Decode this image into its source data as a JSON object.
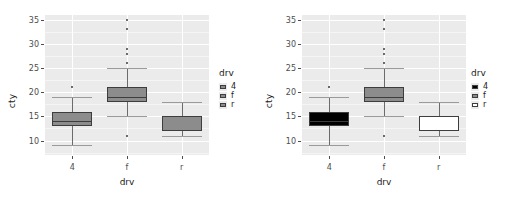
{
  "figure": {
    "panels": [
      {
        "id": "left",
        "fill_mode": "uniform-grey",
        "axis": {
          "ylabel": "cty",
          "xlabel": "drv"
        },
        "legend": {
          "title": "drv",
          "items": [
            {
              "label": "4",
              "color": "#8c8c8c"
            },
            {
              "label": "f",
              "color": "#8c8c8c"
            },
            {
              "label": "r",
              "color": "#8c8c8c"
            }
          ]
        }
      },
      {
        "id": "right",
        "fill_mode": "greyscale-ramp",
        "axis": {
          "ylabel": "cty",
          "xlabel": "drv"
        },
        "legend": {
          "title": "drv",
          "items": [
            {
              "label": "4",
              "color": "#000000"
            },
            {
              "label": "f",
              "color": "#8c8c8c"
            },
            {
              "label": "r",
              "color": "#ffffff"
            }
          ]
        }
      }
    ]
  },
  "chart_data": [
    {
      "type": "box",
      "title": "",
      "xlabel": "drv",
      "ylabel": "cty",
      "ylim": [
        7,
        36
      ],
      "yticks": [
        10,
        15,
        20,
        25,
        30,
        35
      ],
      "ytick_labels": [
        "10",
        "15",
        "20",
        "25",
        "30",
        "35"
      ],
      "categories": [
        "4",
        "f",
        "r"
      ],
      "grid": true,
      "legend": {
        "title": "drv",
        "position": "right",
        "entries": [
          "4",
          "f",
          "r"
        ]
      },
      "fills": [
        "#8c8c8c",
        "#8c8c8c",
        "#8c8c8c"
      ],
      "boxes": [
        {
          "category": "4",
          "min": 9,
          "q1": 13,
          "median": 14,
          "q3": 16,
          "max": 19,
          "outliers": [
            21
          ]
        },
        {
          "category": "f",
          "min": 15,
          "q1": 18,
          "median": 19,
          "q3": 21,
          "max": 25,
          "outliers": [
            35,
            33,
            29,
            28,
            26,
            11
          ]
        },
        {
          "category": "r",
          "min": 11,
          "q1": 12,
          "median": 15,
          "q3": 15,
          "max": 18,
          "outliers": []
        }
      ]
    },
    {
      "type": "box",
      "title": "",
      "xlabel": "drv",
      "ylabel": "cty",
      "ylim": [
        7,
        36
      ],
      "yticks": [
        10,
        15,
        20,
        25,
        30,
        35
      ],
      "ytick_labels": [
        "10",
        "15",
        "20",
        "25",
        "30",
        "35"
      ],
      "categories": [
        "4",
        "f",
        "r"
      ],
      "grid": true,
      "legend": {
        "title": "drv",
        "position": "right",
        "entries": [
          "4",
          "f",
          "r"
        ]
      },
      "fills": [
        "#000000",
        "#8c8c8c",
        "#ffffff"
      ],
      "boxes": [
        {
          "category": "4",
          "min": 9,
          "q1": 13,
          "median": 14,
          "q3": 16,
          "max": 19,
          "outliers": [
            21
          ]
        },
        {
          "category": "f",
          "min": 15,
          "q1": 18,
          "median": 19,
          "q3": 21,
          "max": 25,
          "outliers": [
            35,
            33,
            29,
            28,
            26,
            11
          ]
        },
        {
          "category": "r",
          "min": 11,
          "q1": 12,
          "median": 15,
          "q3": 15,
          "max": 18,
          "outliers": []
        }
      ]
    }
  ]
}
